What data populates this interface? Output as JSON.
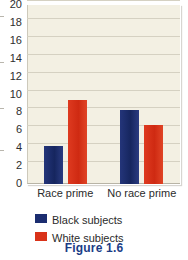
{
  "figure": {
    "caption": "Figure 1.6"
  },
  "legend": {
    "position": "bottom",
    "entries": [
      {
        "label": "Black subjects",
        "color": "#1b2d70"
      },
      {
        "label": "White subjects",
        "color": "#d93219"
      }
    ]
  },
  "axis": {
    "y_ticks": [
      "20",
      "18",
      "16",
      "14",
      "12",
      "10",
      "8",
      "6",
      "4",
      "2",
      "0"
    ]
  },
  "chart_data": {
    "type": "bar",
    "title": "Figure 1.6",
    "xlabel": "",
    "ylabel": "",
    "categories": [
      "Race prime",
      "No race prime"
    ],
    "series": [
      {
        "name": "Black subjects",
        "color": "#1b2d70",
        "values": [
          4.3,
          8.3
        ]
      },
      {
        "name": "White subjects",
        "color": "#d93219",
        "values": [
          9.4,
          6.6
        ]
      }
    ],
    "ylim": [
      0,
      20
    ],
    "ytick_step": 2,
    "grid": true,
    "legend_position": "bottom",
    "plot_background": "#f3f0e3"
  }
}
